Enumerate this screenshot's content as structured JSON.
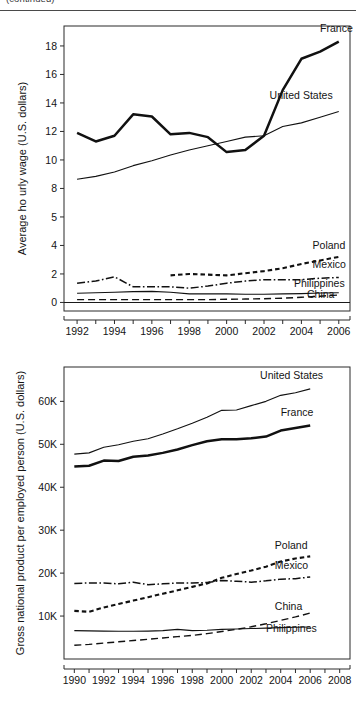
{
  "header": {
    "running_text": "(continued)"
  },
  "chart_data": [
    {
      "id": "average-hourly-wage",
      "type": "line",
      "title": "",
      "xlabel": "",
      "ylabel": "Average ho  urly wage (U.S. dollars)",
      "xlim": [
        1991.3,
        2006.6
      ],
      "ylim": [
        -0.6,
        19.4
      ],
      "xticks": [
        1992,
        1994,
        1996,
        1998,
        2000,
        2002,
        2004,
        2006
      ],
      "xtick_labels": [
        "1992",
        "1994",
        "1996",
        "1998",
        "2000",
        "2002",
        "2004",
        "2006"
      ],
      "xminor_step": 1,
      "yticks": [
        0,
        2,
        4,
        5,
        8,
        10,
        12,
        14,
        16,
        18
      ],
      "ytick_labels": [
        "0",
        "2",
        "4",
        "5",
        "8",
        "10",
        "12",
        "14",
        "16",
        "18"
      ],
      "ytick_values": [
        0,
        2,
        4,
        6,
        8,
        10,
        12,
        14,
        16,
        18
      ],
      "grid": false,
      "legend_position": "inline-right",
      "zero_line": 0,
      "series": [
        {
          "name": "France",
          "style": "thick-solid",
          "label_x": 2005.0,
          "label_y": 19.0,
          "x": [
            1992,
            1993,
            1994,
            1995,
            1996,
            1997,
            1998,
            1999,
            2000,
            2001,
            2002,
            2003,
            2004,
            2005,
            2006
          ],
          "values": [
            11.9,
            11.3,
            11.7,
            13.2,
            13.05,
            11.8,
            11.9,
            11.6,
            10.55,
            10.7,
            11.7,
            14.9,
            17.1,
            17.6,
            18.3
          ]
        },
        {
          "name": "United States",
          "style": "thin-solid",
          "label_x": 2002.3,
          "label_y": 14.3,
          "x": [
            1992,
            1993,
            1994,
            1995,
            1996,
            1997,
            1998,
            1999,
            2000,
            2001,
            2002,
            2003,
            2004,
            2005,
            2006
          ],
          "values": [
            8.65,
            8.85,
            9.15,
            9.6,
            9.95,
            10.35,
            10.7,
            11.0,
            11.3,
            11.6,
            11.7,
            12.35,
            12.6,
            13.0,
            13.4
          ]
        },
        {
          "name": "Poland",
          "style": "dashed",
          "label_x": 2004.6,
          "label_y": 3.75,
          "x": [
            1997,
            1998,
            1999,
            2000,
            2001,
            2002,
            2003,
            2004,
            2005,
            2006
          ],
          "values": [
            1.9,
            2.0,
            1.95,
            1.9,
            2.05,
            2.2,
            2.4,
            2.7,
            2.95,
            3.2
          ]
        },
        {
          "name": "Mexico",
          "style": "dash-dot",
          "label_x": 2004.6,
          "label_y": 2.4,
          "x": [
            1992,
            1993,
            1994,
            1995,
            1996,
            1997,
            1998,
            1999,
            2000,
            2001,
            2002,
            2003,
            2004,
            2005,
            2006
          ],
          "values": [
            1.35,
            1.5,
            1.8,
            1.1,
            1.1,
            1.1,
            1.0,
            1.15,
            1.35,
            1.5,
            1.6,
            1.6,
            1.6,
            1.7,
            1.75
          ]
        },
        {
          "name": "Philippines",
          "style": "thin-solid",
          "label_x": 2003.6,
          "label_y": 1.05,
          "x": [
            1992,
            1993,
            1994,
            1995,
            1996,
            1997,
            1998,
            1999,
            2000,
            2001,
            2002,
            2003,
            2004,
            2005,
            2006
          ],
          "values": [
            0.65,
            0.68,
            0.72,
            0.76,
            0.78,
            0.72,
            0.6,
            0.6,
            0.6,
            0.58,
            0.58,
            0.6,
            0.62,
            0.66,
            0.68
          ]
        },
        {
          "name": "China",
          "style": "long-dash",
          "label_x": 2004.3,
          "label_y": 0.32,
          "x": [
            1992,
            1993,
            1994,
            1995,
            1996,
            1997,
            1998,
            1999,
            2000,
            2001,
            2002,
            2003,
            2004,
            2005,
            2006
          ],
          "values": [
            0.2,
            0.2,
            0.2,
            0.2,
            0.2,
            0.2,
            0.2,
            0.2,
            0.22,
            0.24,
            0.26,
            0.3,
            0.36,
            0.44,
            0.52
          ]
        }
      ]
    },
    {
      "id": "gnp-per-employed-person",
      "type": "line",
      "title": "",
      "xlabel": "",
      "ylabel": "Gross national product per employed person (U.S. dollars)",
      "xlim": [
        1989.3,
        2008.7
      ],
      "ylim": [
        0,
        68000
      ],
      "xticks": [
        1990,
        1992,
        1994,
        1996,
        1998,
        2000,
        2002,
        2004,
        2006,
        2008
      ],
      "xtick_labels": [
        "1990",
        "1992",
        "1994",
        "1996",
        "1998",
        "2000",
        "2002",
        "2004",
        "2006",
        "2008"
      ],
      "xminor_step": 1,
      "yticks": [
        10000,
        20000,
        30000,
        40000,
        50000,
        60000
      ],
      "ytick_labels": [
        "10K",
        "20K",
        "30K",
        "40K",
        "50K",
        "60K"
      ],
      "grid": false,
      "legend_position": "inline-right",
      "series": [
        {
          "name": "United States",
          "style": "thin-solid",
          "label_x": 2002.6,
          "label_y": 65200,
          "x": [
            1990,
            1991,
            1992,
            1993,
            1994,
            1995,
            1996,
            1997,
            1998,
            1999,
            2000,
            2001,
            2002,
            2003,
            2004,
            2005,
            2006
          ],
          "values": [
            47700,
            48000,
            49300,
            49900,
            50700,
            51300,
            52400,
            53600,
            54900,
            56300,
            57900,
            58000,
            59000,
            60000,
            61400,
            62000,
            62900
          ]
        },
        {
          "name": "France",
          "style": "thick-solid",
          "label_x": 2004.0,
          "label_y": 56600,
          "x": [
            1990,
            1991,
            1992,
            1993,
            1994,
            1995,
            1996,
            1997,
            1998,
            1999,
            2000,
            2001,
            2002,
            2003,
            2004,
            2005,
            2006
          ],
          "values": [
            44800,
            45000,
            46200,
            46100,
            47100,
            47400,
            48000,
            48800,
            49800,
            50700,
            51200,
            51200,
            51400,
            51800,
            53200,
            53800,
            54400
          ]
        },
        {
          "name": "Poland",
          "style": "dashed",
          "label_x": 2003.6,
          "label_y": 25700,
          "x": [
            1990,
            1991,
            1992,
            1993,
            1994,
            1995,
            1996,
            1997,
            1998,
            1999,
            2000,
            2001,
            2002,
            2003,
            2004,
            2005,
            2006
          ],
          "values": [
            11200,
            11000,
            12000,
            12800,
            13600,
            14400,
            15200,
            16000,
            16800,
            17600,
            18900,
            19800,
            20600,
            21500,
            22700,
            23400,
            23900
          ]
        },
        {
          "name": "Mexico",
          "style": "dash-dot",
          "label_x": 2003.6,
          "label_y": 20900,
          "x": [
            1990,
            1991,
            1992,
            1993,
            1994,
            1995,
            1996,
            1997,
            1998,
            1999,
            2000,
            2001,
            2002,
            2003,
            2004,
            2005,
            2006
          ],
          "values": [
            17600,
            17700,
            17700,
            17500,
            17900,
            17300,
            17500,
            17700,
            17700,
            17800,
            18300,
            18100,
            17900,
            18200,
            18600,
            18700,
            19100
          ]
        },
        {
          "name": "China",
          "style": "long-dash",
          "label_x": 2003.6,
          "label_y": 11300,
          "x": [
            1990,
            1991,
            1992,
            1993,
            1994,
            1995,
            1996,
            1997,
            1998,
            1999,
            2000,
            2001,
            2002,
            2003,
            2004,
            2005,
            2006
          ],
          "values": [
            3200,
            3400,
            3700,
            4000,
            4300,
            4600,
            4900,
            5200,
            5500,
            5900,
            6400,
            6900,
            7500,
            8200,
            9000,
            9800,
            10700
          ]
        },
        {
          "name": "Philippines",
          "style": "thin-solid",
          "label_x": 2003.0,
          "label_y": 6200,
          "x": [
            1990,
            1991,
            1992,
            1993,
            1994,
            1995,
            1996,
            1997,
            1998,
            1999,
            2000,
            2001,
            2002,
            2003,
            2004,
            2005,
            2006
          ],
          "values": [
            6600,
            6550,
            6500,
            6450,
            6450,
            6500,
            6600,
            6900,
            6600,
            6700,
            6900,
            7000,
            7100,
            7200,
            7300,
            7400,
            7450
          ]
        }
      ]
    }
  ]
}
